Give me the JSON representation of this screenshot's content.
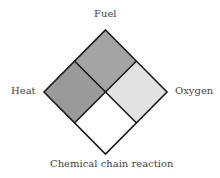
{
  "diagram": {
    "labels": {
      "top": "Fuel",
      "left": "Heat",
      "right": "Oxygen",
      "bottom": "Chemical chain reaction"
    },
    "quadrants": [
      {
        "name": "Fuel",
        "position": "top",
        "color": "#a4a4a4"
      },
      {
        "name": "Heat",
        "position": "left",
        "color": "#9a9a9a"
      },
      {
        "name": "Oxygen",
        "position": "right",
        "color": "#e2e2e2"
      },
      {
        "name": "Chemical chain reaction",
        "position": "bottom",
        "color": "#ffffff"
      }
    ],
    "stroke_color": "#1a1a1a"
  }
}
